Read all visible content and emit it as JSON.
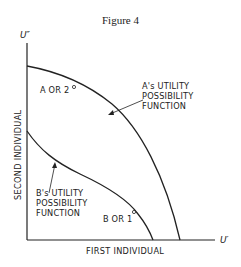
{
  "figure": {
    "title": "Figure 4",
    "y_axis_symbol": "U″",
    "x_axis_symbol": "U′",
    "y_axis_label": "SECOND INDIVIDUAL",
    "x_axis_label": "FIRST INDIVIDUAL",
    "curve_a": {
      "label_lines": [
        "A's UTILITY",
        "POSSIBILITY",
        "FUNCTION"
      ],
      "point_label": "A OR 2"
    },
    "curve_b": {
      "label_lines": [
        "B's UTILITY",
        "POSSIBILITY",
        "FUNCTION"
      ],
      "point_label": "B OR 1"
    },
    "colors": {
      "ink": "#222222",
      "background": "#ffffff"
    }
  }
}
